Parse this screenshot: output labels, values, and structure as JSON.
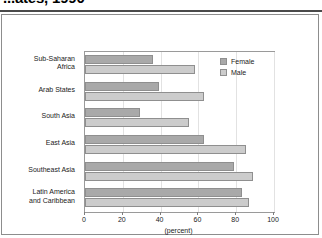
{
  "title": {
    "text": "...ates, 1990",
    "note_clipped": true
  },
  "chart_data": {
    "type": "bar",
    "orientation": "horizontal",
    "title": "",
    "xlabel": "(percent)",
    "ylabel": "",
    "xlim": [
      0,
      100
    ],
    "xticks": [
      0,
      20,
      40,
      60,
      80,
      100
    ],
    "xtick_labels": [
      "0",
      "20",
      "40",
      "60",
      "80",
      "100"
    ],
    "grid": true,
    "legend_position": "top-right",
    "categories": [
      "Sub-Saharan Africa",
      "Arab States",
      "South Asia",
      "East Asia",
      "Southeast Asia",
      "Latin America and Caribbean"
    ],
    "category_lines": [
      [
        "Sub-Saharan",
        "Africa"
      ],
      [
        "Arab States"
      ],
      [
        "South Asia"
      ],
      [
        "East Asia"
      ],
      [
        "Southeast Asia"
      ],
      [
        "Latin America",
        "and Caribbean"
      ]
    ],
    "series": [
      {
        "name": "Female",
        "color": "#a9a9a9",
        "values": [
          36,
          39,
          29,
          63,
          79,
          83
        ]
      },
      {
        "name": "Male",
        "color": "#cccccc",
        "values": [
          58,
          63,
          55,
          85,
          89,
          87
        ]
      }
    ]
  },
  "legend": {
    "items": [
      {
        "label": "Female",
        "swatch": "female"
      },
      {
        "label": "Male",
        "swatch": "male"
      }
    ]
  },
  "axis": {
    "x_title": "(percent)"
  }
}
